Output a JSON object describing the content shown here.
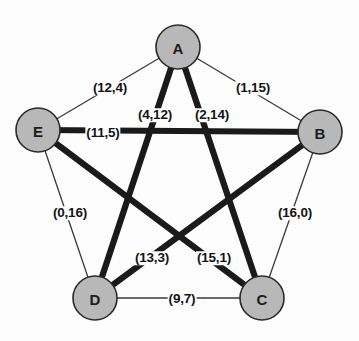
{
  "diagram": {
    "type": "node-link-graph",
    "canvas": {
      "width": 359,
      "height": 341,
      "background": "#fdfdfd"
    },
    "colors": {
      "node_fill": "#b8b8b8",
      "node_stroke": "#2b2b2b",
      "thin_edge": "#3a3a3a",
      "thick_edge": "#1a1a1a",
      "label_text": "#141414"
    },
    "nodes": [
      {
        "id": "A",
        "label": "A",
        "cx": 178,
        "cy": 47,
        "r": 22
      },
      {
        "id": "B",
        "label": "B",
        "cx": 320,
        "cy": 132,
        "r": 22
      },
      {
        "id": "C",
        "label": "C",
        "cx": 262,
        "cy": 298,
        "r": 22
      },
      {
        "id": "D",
        "label": "D",
        "cx": 95,
        "cy": 298,
        "r": 22
      },
      {
        "id": "E",
        "label": "E",
        "cx": 38,
        "cy": 130,
        "r": 22
      }
    ],
    "edges": [
      {
        "id": "A-E",
        "from": "A",
        "to": "E",
        "weight": "(12,4)",
        "style": "thin",
        "label_x": 110,
        "label_y": 88
      },
      {
        "id": "A-B",
        "from": "A",
        "to": "B",
        "weight": "(1,15)",
        "style": "thin",
        "label_x": 253,
        "label_y": 88
      },
      {
        "id": "E-D",
        "from": "E",
        "to": "D",
        "weight": "(0,16)",
        "style": "thin",
        "label_x": 70,
        "label_y": 213
      },
      {
        "id": "B-C",
        "from": "B",
        "to": "C",
        "weight": "(16,0)",
        "style": "thin",
        "label_x": 295,
        "label_y": 213
      },
      {
        "id": "D-C",
        "from": "D",
        "to": "C",
        "weight": "(9,7)",
        "style": "thin",
        "label_x": 182,
        "label_y": 299
      },
      {
        "id": "E-B",
        "from": "E",
        "to": "B",
        "weight": "(11,5)",
        "style": "thick",
        "label_x": 103,
        "label_y": 133
      },
      {
        "id": "A-D",
        "from": "A",
        "to": "D",
        "weight": "(4,12)",
        "style": "thick",
        "label_x": 155,
        "label_y": 115
      },
      {
        "id": "A-C",
        "from": "A",
        "to": "C",
        "weight": "(2,14)",
        "style": "thick",
        "label_x": 212,
        "label_y": 115
      },
      {
        "id": "D-B",
        "from": "D",
        "to": "B",
        "weight": "(13,3)",
        "style": "thick",
        "label_x": 152,
        "label_y": 258
      },
      {
        "id": "E-C",
        "from": "E",
        "to": "C",
        "weight": "(15,1)",
        "style": "thick",
        "label_x": 214,
        "label_y": 258
      }
    ]
  }
}
